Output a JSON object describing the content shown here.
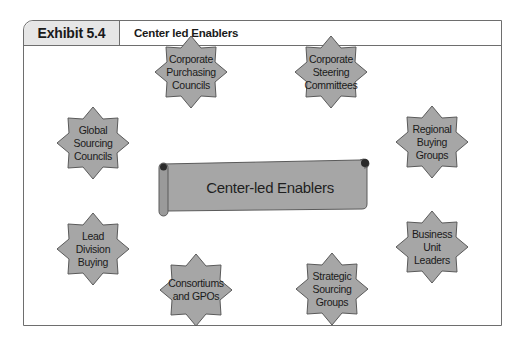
{
  "header": {
    "exhibit_label": "Exhibit 5.4",
    "title": "Center led Enablers"
  },
  "center": {
    "label": "Center-led Enablers"
  },
  "enablers": [
    {
      "id": "corporate-purchasing-councils",
      "lines": [
        "Corporate",
        "Purchasing",
        "Councils"
      ]
    },
    {
      "id": "corporate-steering-committees",
      "lines": [
        "Corporate",
        "Steering",
        "Committees"
      ]
    },
    {
      "id": "global-sourcing-councils",
      "lines": [
        "Global",
        "Sourcing",
        "Councils"
      ]
    },
    {
      "id": "regional-buying-groups",
      "lines": [
        "Regional",
        "Buying",
        "Groups"
      ]
    },
    {
      "id": "lead-division-buying",
      "lines": [
        "Lead",
        "Division",
        "Buying"
      ]
    },
    {
      "id": "business-unit-leaders",
      "lines": [
        "Business",
        "Unit",
        "Leaders"
      ]
    },
    {
      "id": "consortiums-and-gpos",
      "lines": [
        "Consortiums",
        "and GPOs"
      ]
    },
    {
      "id": "strategic-sourcing-groups",
      "lines": [
        "Strategic",
        "Sourcing",
        "Groups"
      ]
    }
  ],
  "colors": {
    "shape_fill": "#a6a6a6",
    "shape_stroke": "#5a5a5a",
    "tab_fill": "#e6e6e6",
    "frame_stroke": "#6e6e6e"
  }
}
